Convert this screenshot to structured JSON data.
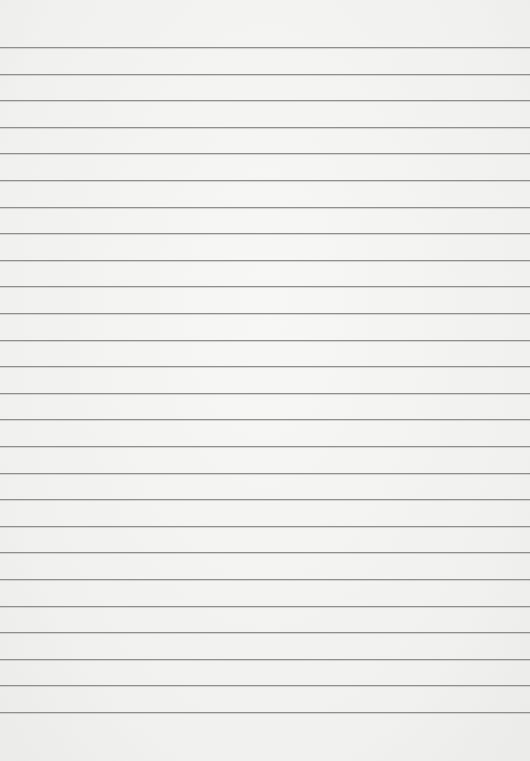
{
  "page": {
    "type": "lined-paper",
    "background_color": "#f3f3f1",
    "line_color": "#8f8f8f",
    "line_count": 26,
    "first_line_y": 47,
    "line_spacing": 26.6,
    "text": ""
  }
}
